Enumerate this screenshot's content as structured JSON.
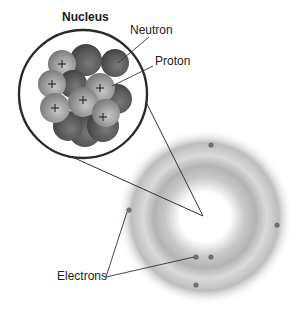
{
  "diagram": {
    "type": "atom-structure",
    "labels": {
      "nucleus": "Nucleus",
      "neutron": "Neutron",
      "proton": "Proton",
      "electrons": "Electrons"
    },
    "colors": {
      "proton": "#9a9a9a",
      "neutron": "#5a5a5a",
      "outline": "#333333",
      "electron": "#707070",
      "cloud": "#b8b8b8"
    },
    "nucleus_inset": {
      "cx": 83,
      "cy": 94,
      "r": 64
    },
    "atom_center": {
      "x": 205,
      "y": 217
    },
    "electrons": [
      {
        "x": 211,
        "y": 145
      },
      {
        "x": 277,
        "y": 225
      },
      {
        "x": 196,
        "y": 257
      },
      {
        "x": 211,
        "y": 257
      },
      {
        "x": 196,
        "y": 285
      },
      {
        "x": 129,
        "y": 210
      }
    ],
    "proton_symbol": "+"
  }
}
